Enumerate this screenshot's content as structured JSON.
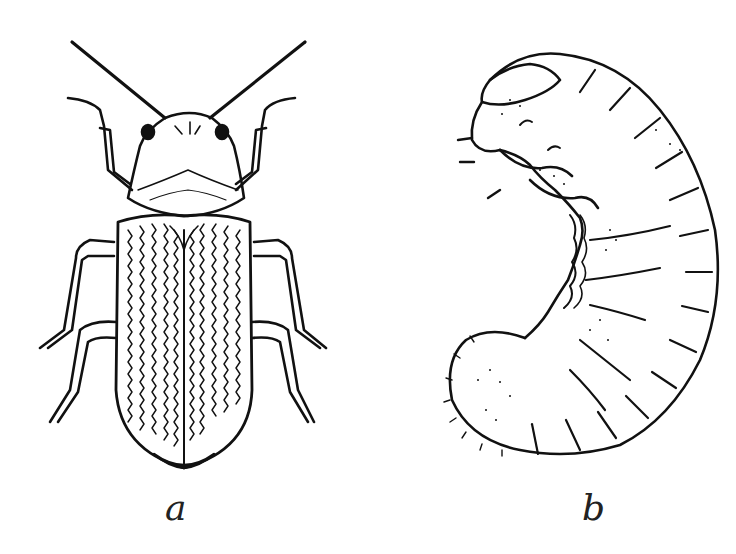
{
  "figure": {
    "panels": [
      {
        "id": "a",
        "label": "a",
        "subject": "adult beetle, dorsal view"
      },
      {
        "id": "b",
        "label": "b",
        "subject": "C-shaped larva (grub)"
      }
    ],
    "colors": {
      "ink": "#111111",
      "background": "#ffffff"
    }
  }
}
